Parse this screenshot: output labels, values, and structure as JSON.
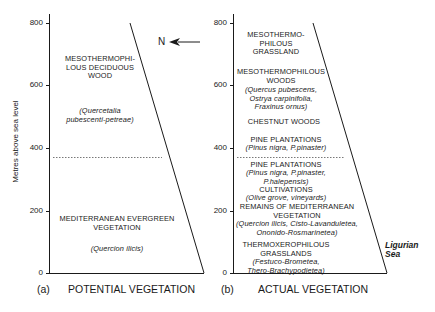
{
  "y_axis": {
    "label": "Metres above sea level",
    "ticks": [
      "800",
      "600",
      "400",
      "200",
      "0"
    ],
    "range": [
      0,
      800
    ]
  },
  "north_indicator": {
    "label": "N",
    "icon": "arrow-left-icon"
  },
  "panel_a": {
    "letter": "(a)",
    "title": "POTENTIAL VEGETATION",
    "zones": [
      {
        "name": "MESOTHERMOPHI-\nLOUS DECIDUOUS\nWOOD",
        "latin": "(Quercetalia\npubescenti-petreae)"
      },
      {
        "name": "MEDITERRANEAN EVERGREEN\nVEGETATION",
        "latin": "(Quercion ilicis)"
      }
    ],
    "boundary_m": 380
  },
  "panel_b": {
    "letter": "(b)",
    "title": "ACTUAL VEGETATION",
    "zones": [
      {
        "name": "MESOTHERMO-\nPHILOUS\nGRASSLAND",
        "latin": ""
      },
      {
        "name": "MESOTHERMOPHILOUS\nWOODS",
        "latin": "(Quercus pubescens,\nOstrya carpinifolia,\nFraxinus ornus)"
      },
      {
        "name": "CHESTNUT WOODS",
        "latin": ""
      },
      {
        "name": "PINE PLANTATIONS",
        "latin": "(Pinus nigra, P.pinaster)"
      },
      {
        "name": "PINE PLANTATIONS",
        "latin": "(Pinus nigra, P.pinaster,\nP.halepensis)"
      },
      {
        "name": "CULTIVATIONS",
        "latin": "(Olive grove, vineyards)"
      },
      {
        "name": "REMAINS OF MEDITERRANEAN\nVEGETATION",
        "latin": "(Quercion ilicis, Cisto-Lavanduletea,\nOnonido-Rosmarinetea)"
      },
      {
        "name": "THERMOXEROPHILOUS\nGRASSLANDS",
        "latin": "(Festuco-Brometea,\nThero-Brachypodietea)"
      }
    ],
    "boundary_m": 380
  },
  "sea_label": "Ligurian\nSea",
  "colors": {
    "line": "#1a1a1a",
    "background": "#ffffff",
    "dotted": "#555555"
  }
}
